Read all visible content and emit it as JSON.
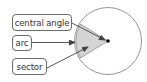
{
  "diagram": {
    "labels": [
      {
        "id": "central-angle",
        "text": "central angle"
      },
      {
        "id": "arc",
        "text": "arc"
      },
      {
        "id": "sector",
        "text": "sector"
      }
    ],
    "colors": {
      "sector_fill": "#d4d4d4",
      "stroke": "#555555",
      "circle_stroke": "#7a7a7a",
      "center_dot": "#000000"
    }
  }
}
